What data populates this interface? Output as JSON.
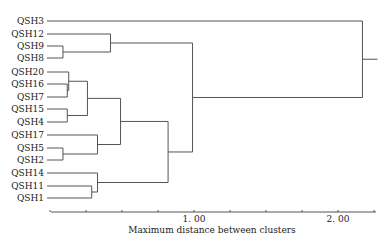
{
  "chart_data": {
    "type": "dendrogram",
    "title": "",
    "xlabel": "Maximum distance between clusters",
    "ylabel": "",
    "xlim": [
      0,
      2.25
    ],
    "x_ticks": [
      0,
      0.25,
      0.5,
      0.75,
      1.0,
      1.25,
      1.5,
      1.75,
      2.0,
      2.25
    ],
    "x_tick_labels": [
      {
        "value": 1.0,
        "label": "1. 00"
      },
      {
        "value": 2.0,
        "label": "2. 00"
      }
    ],
    "leaves": [
      "QSH3",
      "QSH12",
      "QSH9",
      "QSH8",
      "QSH20",
      "QSH16",
      "QSH7",
      "QSH15",
      "QSH4",
      "QSH17",
      "QSH5",
      "QSH2",
      "QSH14",
      "QSH11",
      "QSH1"
    ],
    "merges": [
      {
        "a": "QSH9",
        "b": "QSH8",
        "height": 0.09
      },
      {
        "a": "QSH12",
        "b": "QSH9+QSH8",
        "height": 0.42
      },
      {
        "a": "QSH16",
        "b": "QSH7",
        "height": 0.12
      },
      {
        "a": "QSH20",
        "b": "QSH16+QSH7",
        "height": 0.13
      },
      {
        "a": "QSH15",
        "b": "QSH4",
        "height": 0.12
      },
      {
        "a": "QSH20-QSH7",
        "b": "QSH15+QSH4",
        "height": 0.26
      },
      {
        "a": "QSH5",
        "b": "QSH2",
        "height": 0.09
      },
      {
        "a": "QSH17",
        "b": "QSH5+QSH2",
        "height": 0.33
      },
      {
        "a": "QSH20-QSH4",
        "b": "QSH17-QSH2",
        "height": 0.49
      },
      {
        "a": "QSH11",
        "b": "QSH1",
        "height": 0.29
      },
      {
        "a": "QSH14",
        "b": "QSH11+QSH1",
        "height": 0.33
      },
      {
        "a": "QSH20-QSH2",
        "b": "QSH14-QSH1",
        "height": 0.82
      },
      {
        "a": "QSH12-QSH8",
        "b": "QSH20-QSH1",
        "height": 0.99
      },
      {
        "a": "QSH3",
        "b": "rest",
        "height": 2.17
      }
    ]
  }
}
